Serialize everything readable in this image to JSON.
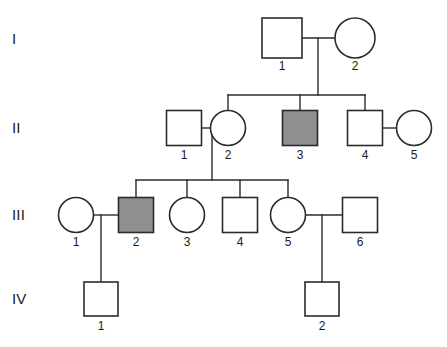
{
  "figure": {
    "type": "pedigree-chart",
    "title": "",
    "background_color": "#ffffff",
    "line_color": "#2b2b2b",
    "affected_fill_color": "#8f8f8f",
    "unaffected_fill_color": "#ffffff",
    "text_color": "#1a1a1a"
  },
  "legend_keys": {
    "square_meaning": "male",
    "circle_meaning": "female",
    "shaded_meaning": "affected",
    "unshaded_meaning": "unaffected"
  },
  "generations": [
    {
      "label": "I",
      "label_x": 12,
      "label_y": 44,
      "row_y": 38,
      "individuals": [
        {
          "id": "1",
          "shape": "square",
          "sex": "male",
          "affected": false,
          "cx": 282,
          "cy": 38,
          "size": 40,
          "label_y": 70
        },
        {
          "id": "2",
          "shape": "circle",
          "sex": "female",
          "affected": false,
          "cx": 355,
          "cy": 38,
          "size": 40,
          "label_y": 70
        }
      ]
    },
    {
      "label": "II",
      "label_x": 12,
      "label_y": 133,
      "row_y": 128,
      "individuals": [
        {
          "id": "1",
          "shape": "square",
          "sex": "male",
          "affected": false,
          "cx": 184,
          "cy": 128,
          "size": 35,
          "label_y": 159
        },
        {
          "id": "2",
          "shape": "circle",
          "sex": "female",
          "affected": false,
          "cx": 228,
          "cy": 128,
          "size": 35,
          "label_y": 159
        },
        {
          "id": "3",
          "shape": "square",
          "sex": "male",
          "affected": true,
          "cx": 300,
          "cy": 128,
          "size": 35,
          "label_y": 159
        },
        {
          "id": "4",
          "shape": "square",
          "sex": "male",
          "affected": false,
          "cx": 365,
          "cy": 128,
          "size": 35,
          "label_y": 159
        },
        {
          "id": "5",
          "shape": "circle",
          "sex": "female",
          "affected": false,
          "cx": 414,
          "cy": 128,
          "size": 35,
          "label_y": 159
        }
      ]
    },
    {
      "label": "III",
      "label_x": 12,
      "label_y": 220,
      "row_y": 215,
      "individuals": [
        {
          "id": "1",
          "shape": "circle",
          "sex": "female",
          "affected": false,
          "cx": 76,
          "cy": 215,
          "size": 35,
          "label_y": 246
        },
        {
          "id": "2",
          "shape": "square",
          "sex": "male",
          "affected": true,
          "cx": 136,
          "cy": 215,
          "size": 35,
          "label_y": 246
        },
        {
          "id": "3",
          "shape": "circle",
          "sex": "female",
          "affected": false,
          "cx": 187,
          "cy": 215,
          "size": 35,
          "label_y": 246
        },
        {
          "id": "4",
          "shape": "square",
          "sex": "male",
          "affected": false,
          "cx": 240,
          "cy": 215,
          "size": 35,
          "label_y": 246
        },
        {
          "id": "5",
          "shape": "circle",
          "sex": "female",
          "affected": false,
          "cx": 288,
          "cy": 215,
          "size": 35,
          "label_y": 246
        },
        {
          "id": "6",
          "shape": "square",
          "sex": "male",
          "affected": false,
          "cx": 360,
          "cy": 215,
          "size": 35,
          "label_y": 246
        }
      ]
    },
    {
      "label": "IV",
      "label_x": 12,
      "label_y": 304,
      "row_y": 299,
      "individuals": [
        {
          "id": "1",
          "shape": "square",
          "sex": "male",
          "affected": false,
          "cx": 101,
          "cy": 299,
          "size": 34,
          "label_y": 330
        },
        {
          "id": "2",
          "shape": "square",
          "sex": "male",
          "affected": false,
          "cx": 322,
          "cy": 299,
          "size": 34,
          "label_y": 330
        }
      ]
    }
  ],
  "matings": [
    {
      "name": "I1-I2",
      "x1": 302,
      "x2": 335,
      "y": 38,
      "drop_x": 318,
      "drop_y2": 95
    },
    {
      "name": "II1-II2",
      "x1": 202,
      "x2": 210,
      "y": 128,
      "drop_x": 212,
      "drop_y2": 180
    },
    {
      "name": "II4-II5",
      "x1": 383,
      "x2": 396,
      "y": 128,
      "drop_x": 0,
      "drop_y2": 0
    },
    {
      "name": "III1-III2",
      "x1": 94,
      "x2": 118,
      "y": 215,
      "drop_x": 101,
      "drop_y2": 282
    },
    {
      "name": "III5-III6",
      "x1": 306,
      "x2": 342,
      "y": 215,
      "drop_x": 322,
      "drop_y2": 282
    }
  ],
  "sibships": [
    {
      "name": "gen2-sibship",
      "bar_y": 95,
      "x_start": 228,
      "x_end": 365,
      "children_x": [
        228,
        300,
        365
      ],
      "child_top_y": 110
    },
    {
      "name": "gen3-sibship",
      "bar_y": 180,
      "x_start": 136,
      "x_end": 288,
      "children_x": [
        136,
        187,
        240,
        288
      ],
      "child_top_y": 197
    }
  ]
}
